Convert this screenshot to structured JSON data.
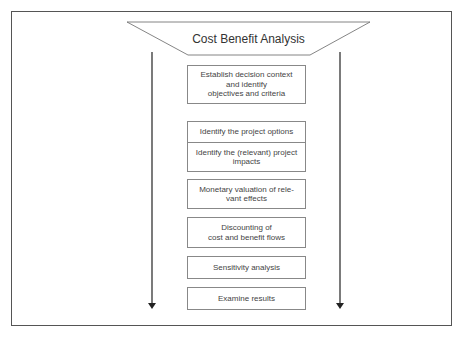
{
  "diagram": {
    "title": "Cost Benefit Analysis",
    "steps": [
      {
        "label": "Establish decision context\nand identify\nobjectives and criteria",
        "top": 65,
        "height": 39
      },
      {
        "label": "Identify the project options",
        "top": 121,
        "height": 22
      },
      {
        "label": "Identify the (relevant) project\nimpacts",
        "top": 142,
        "height": 30
      },
      {
        "label": "Monetary valuation of rele-\nvant effects",
        "top": 179,
        "height": 30
      },
      {
        "label": "Discounting of\ncost and benefit flows",
        "top": 217,
        "height": 31
      },
      {
        "label": "Sensitivity analysis",
        "top": 256,
        "height": 23
      },
      {
        "label": "Examine results",
        "top": 287,
        "height": 23
      }
    ],
    "colors": {
      "line": "#444444",
      "box_border": "#888888",
      "text": "#444444"
    }
  }
}
